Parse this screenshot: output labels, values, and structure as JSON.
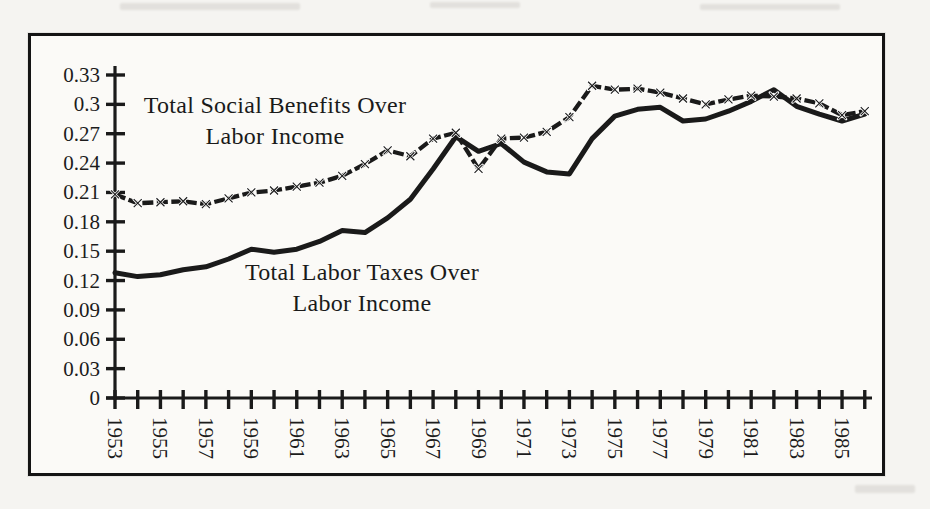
{
  "figure": {
    "colors": {
      "ink": "#1a1a1a",
      "paper": "#fbfaf7",
      "page": "#f5f4f1"
    }
  },
  "chart_data": {
    "type": "line",
    "title": "",
    "xlabel": "",
    "ylabel": "",
    "grid": false,
    "legend": "inline-annotations",
    "xlim": [
      1953,
      1986
    ],
    "ylim": [
      0,
      0.33
    ],
    "x_years": [
      1953,
      1954,
      1955,
      1956,
      1957,
      1958,
      1959,
      1960,
      1961,
      1962,
      1963,
      1964,
      1965,
      1966,
      1967,
      1968,
      1969,
      1970,
      1971,
      1972,
      1973,
      1974,
      1975,
      1976,
      1977,
      1978,
      1979,
      1980,
      1981,
      1982,
      1983,
      1984,
      1985,
      1986
    ],
    "x_axis": {
      "labeled_years": [
        "1953",
        "1955",
        "1957",
        "1959",
        "1961",
        "1963",
        "1965",
        "1967",
        "1969",
        "1971",
        "1973",
        "1975",
        "1977",
        "1979",
        "1981",
        "1983",
        "1985"
      ],
      "tick_every_year": true,
      "label_rotation_deg": 90
    },
    "y_axis": {
      "min": 0,
      "max": 0.33,
      "step": 0.03,
      "tick_labels": [
        "0",
        "0.03",
        "0.06",
        "0.09",
        "0.12",
        "0.15",
        "0.18",
        "0.21",
        "0.24",
        "0.27",
        "0.3",
        "0.33"
      ]
    },
    "series": [
      {
        "name": "Total Social Benefits Over Labor Income",
        "label_text": "Total Social Benefits Over\nLabor Income",
        "marker": "x",
        "line_style": "dashed-thick",
        "color": "#1a1a1a",
        "values": [
          0.208,
          0.199,
          0.2,
          0.201,
          0.198,
          0.204,
          0.21,
          0.212,
          0.216,
          0.22,
          0.227,
          0.239,
          0.253,
          0.247,
          0.265,
          0.271,
          0.234,
          0.265,
          0.266,
          0.272,
          0.287,
          0.319,
          0.315,
          0.316,
          0.312,
          0.306,
          0.3,
          0.305,
          0.309,
          0.308,
          0.306,
          0.301,
          0.289,
          0.293
        ]
      },
      {
        "name": "Total Labor Taxes Over Labor Income",
        "label_text": "Total Labor Taxes Over\nLabor Income",
        "marker": "none",
        "line_style": "solid-thick",
        "color": "#1a1a1a",
        "values": [
          0.128,
          0.124,
          0.126,
          0.131,
          0.134,
          0.142,
          0.152,
          0.149,
          0.152,
          0.16,
          0.171,
          0.169,
          0.184,
          0.203,
          0.234,
          0.267,
          0.252,
          0.26,
          0.241,
          0.231,
          0.229,
          0.265,
          0.288,
          0.295,
          0.297,
          0.283,
          0.285,
          0.293,
          0.303,
          0.315,
          0.298,
          0.29,
          0.283,
          0.29
        ]
      }
    ]
  }
}
